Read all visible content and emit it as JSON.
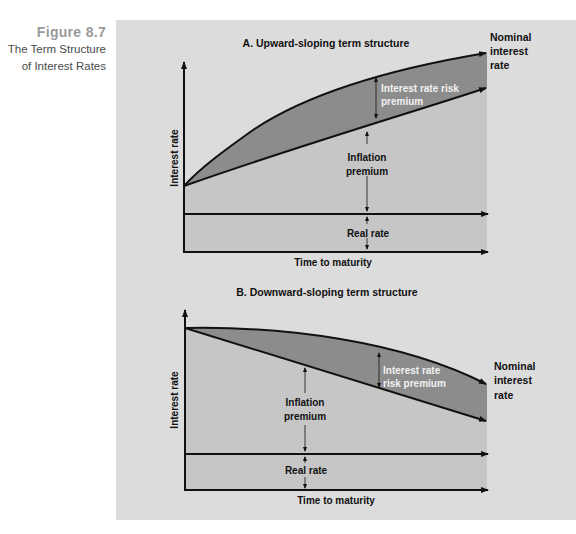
{
  "figure": {
    "number": "Figure 8.7",
    "title_line1": "The Term Structure",
    "title_line2": "of Interest Rates"
  },
  "colors": {
    "panel_bg": "#dcdcdc",
    "plot_fill": "#c6c6c6",
    "risk_premium_fill": "#8c8c8c",
    "line": "#111111",
    "risk_label": "#f2f2f2",
    "caption_number": "#9a9a9a"
  },
  "panel_a": {
    "title": "A. Upward-sloping term structure",
    "y_axis_label": "Interest rate",
    "x_axis_label": "Time to maturity",
    "nominal_label_1": "Nominal",
    "nominal_label_2": "interest",
    "nominal_label_3": "rate",
    "risk_label_1": "Interest rate risk",
    "risk_label_2": "premium",
    "inflation_label_1": "Inflation",
    "inflation_label_2": "premium",
    "real_label": "Real rate"
  },
  "panel_b": {
    "title": "B. Downward-sloping term structure",
    "y_axis_label": "Interest rate",
    "x_axis_label": "Time to maturity",
    "nominal_label_1": "Nominal",
    "nominal_label_2": "interest",
    "nominal_label_3": "rate",
    "risk_label_1": "Interest rate",
    "risk_label_2": "risk premium",
    "inflation_label_1": "Inflation",
    "inflation_label_2": "premium",
    "real_label": "Real rate"
  }
}
